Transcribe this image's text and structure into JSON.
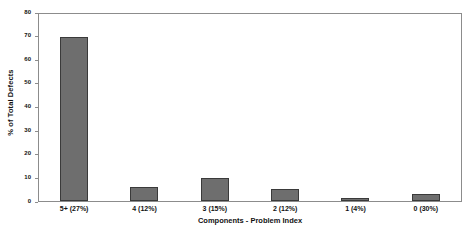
{
  "chart_data": {
    "type": "bar",
    "title": "",
    "xlabel": "Components - Problem Index",
    "ylabel": "% of Total Defects",
    "categories": [
      "5+ (27%)",
      "4 (12%)",
      "3 (15%)",
      "2 (12%)",
      "1 (4%)",
      "0 (30%)"
    ],
    "values": [
      70,
      6,
      10,
      5,
      1.5,
      3
    ],
    "ylim": [
      0,
      80
    ],
    "yticks": [
      0,
      10,
      20,
      30,
      40,
      50,
      60,
      70,
      80
    ],
    "ytick_labels": [
      "0",
      "10",
      "20",
      "30",
      "40",
      "50",
      "60",
      "70",
      "80"
    ],
    "grid": false,
    "legend": null,
    "bar_color": "#6e6e6e",
    "bar_edge_color": "#3a3a3a",
    "frame_color": "#8c8c8c",
    "background": "#ffffff"
  }
}
